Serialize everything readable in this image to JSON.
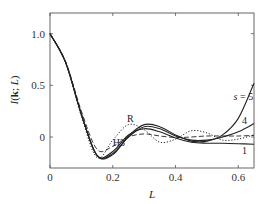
{
  "chart_data": {
    "type": "line",
    "title": "",
    "xlabel": "L",
    "ylabel": "I(k; L)",
    "ylabel_parts": {
      "italic_I": "I",
      "open": "(",
      "bold_k": "k",
      "mid": "; ",
      "italic_L": "L",
      "close": ")"
    },
    "xlim": [
      0,
      0.65
    ],
    "ylim": [
      -0.3,
      1.2
    ],
    "grid": false,
    "legend": "inline labels",
    "x_ticks": [
      0,
      0.2,
      0.4,
      0.6
    ],
    "x_tick_labels": [
      "0",
      "0.2",
      "0.4",
      "0.6"
    ],
    "y_ticks": [
      0,
      0.5,
      1.0
    ],
    "y_tick_labels": [
      "0",
      "0.5",
      "1.0"
    ],
    "x": [
      0,
      0.05,
      0.1,
      0.15,
      0.2,
      0.25,
      0.3,
      0.35,
      0.4,
      0.45,
      0.5,
      0.55,
      0.6,
      0.65
    ],
    "series": [
      {
        "name": "1",
        "style": "solid",
        "values": [
          1.0,
          0.72,
          0.22,
          -0.18,
          -0.14,
          0.02,
          0.08,
          0.05,
          -0.01,
          -0.05,
          -0.06,
          -0.06,
          -0.065,
          -0.07
        ]
      },
      {
        "name": "4",
        "style": "solid",
        "values": [
          1.0,
          0.72,
          0.22,
          -0.18,
          -0.16,
          0.0,
          0.1,
          0.08,
          0.01,
          -0.03,
          -0.03,
          0.0,
          0.05,
          0.13
        ]
      },
      {
        "name": "s = 5",
        "style": "solid",
        "values": [
          1.0,
          0.72,
          0.22,
          -0.18,
          -0.17,
          0.01,
          0.12,
          0.1,
          0.02,
          -0.04,
          -0.04,
          0.02,
          0.18,
          0.52
        ]
      },
      {
        "name": "R",
        "style": "dotted",
        "values": [
          1.0,
          0.72,
          0.2,
          -0.2,
          -0.03,
          0.12,
          0.07,
          -0.05,
          -0.02,
          0.06,
          0.04,
          -0.03,
          -0.02,
          0.02
        ]
      },
      {
        "name": "H3",
        "style": "dashed",
        "values": [
          1.0,
          0.73,
          0.25,
          -0.12,
          -0.09,
          0.0,
          0.03,
          0.01,
          -0.005,
          0.0,
          0.01,
          0.01,
          0.01,
          0.015
        ]
      }
    ],
    "annotations": [
      {
        "text": "R",
        "x": 0.245,
        "y": 0.15
      },
      {
        "text": "H3",
        "x": 0.2,
        "y": -0.09
      },
      {
        "text": "s = 5",
        "x": 0.585,
        "y": 0.36
      },
      {
        "text": "4",
        "x": 0.612,
        "y": 0.13
      },
      {
        "text": "1",
        "x": 0.612,
        "y": -0.16
      }
    ]
  }
}
